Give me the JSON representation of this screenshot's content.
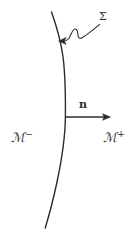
{
  "figure": {
    "background_color": "#ffffff",
    "ink_color": "#2b2b2b",
    "width": 134,
    "height": 235
  },
  "labels": {
    "surface": {
      "text": "Σ",
      "name": "sigma-label",
      "description": "label for the dividing hypersurface"
    },
    "normal_vector": {
      "text": "n",
      "name": "normal-vector-label",
      "description": "unit normal vector to the hypersurface"
    },
    "region_minus": {
      "symbol": "ℳ",
      "superscript": "−",
      "text": "ℳ⁻",
      "description": "manifold region on the left side"
    },
    "region_plus": {
      "symbol": "ℳ",
      "superscript": "+",
      "text": "ℳ⁺",
      "description": "manifold region on the right side"
    }
  },
  "geometry": {
    "curve": {
      "name": "hypersurface-curve",
      "description": "slightly bowed near-vertical curve dividing the plane",
      "stroke_width": 1.4
    },
    "normal_arrow": {
      "name": "normal-arrow",
      "from_x": 65,
      "from_y": 117,
      "to_x": 110,
      "to_y": 117,
      "stroke_width": 1.3
    },
    "leader": {
      "name": "sigma-leader-line",
      "description": "wavy leader from the sigma label with an arrowhead touching the curve",
      "tip_x": 59,
      "tip_y": 41,
      "stroke_width": 1.1
    }
  }
}
